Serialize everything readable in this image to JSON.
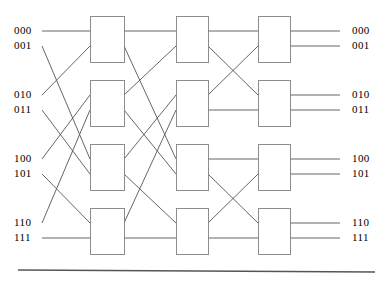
{
  "figure": {
    "width": 383,
    "height": 281,
    "background": "#ffffff",
    "line_color": "#555555",
    "box_fill": "#ffffff",
    "box_stroke": "#808080",
    "text_color": "#000000",
    "rule_color": "#555555"
  },
  "inputs": [
    {
      "label": "000",
      "x": 14,
      "y": 31,
      "port_y": 31
    },
    {
      "label": "001",
      "x": 14,
      "y": 46,
      "port_y": 46
    },
    {
      "label": "010",
      "x": 14,
      "y": 95,
      "port_y": 95
    },
    {
      "label": "011",
      "x": 14,
      "y": 110,
      "port_y": 110
    },
    {
      "label": "100",
      "x": 14,
      "y": 159,
      "port_y": 159
    },
    {
      "label": "101",
      "x": 14,
      "y": 174,
      "port_y": 174
    },
    {
      "label": "110",
      "x": 14,
      "y": 223,
      "port_y": 223
    },
    {
      "label": "111",
      "x": 14,
      "y": 238,
      "port_y": 238
    }
  ],
  "outputs": [
    {
      "label": "000",
      "x": 352,
      "y": 31,
      "port_y": 31
    },
    {
      "label": "001",
      "x": 352,
      "y": 46,
      "port_y": 46
    },
    {
      "label": "010",
      "x": 352,
      "y": 95,
      "port_y": 95
    },
    {
      "label": "011",
      "x": 352,
      "y": 110,
      "port_y": 110
    },
    {
      "label": "100",
      "x": 352,
      "y": 159,
      "port_y": 159
    },
    {
      "label": "101",
      "x": 352,
      "y": 174,
      "port_y": 174
    },
    {
      "label": "110",
      "x": 352,
      "y": 223,
      "port_y": 223
    },
    {
      "label": "111",
      "x": 352,
      "y": 238,
      "port_y": 238
    }
  ],
  "stages": [
    {
      "name": "stage-1",
      "x_left": 90,
      "x_right": 124,
      "switches": [
        {
          "name": "switch-1-1",
          "y_top": 16,
          "y_bottom": 62
        },
        {
          "name": "switch-1-2",
          "y_top": 80,
          "y_bottom": 126
        },
        {
          "name": "switch-1-3",
          "y_top": 144,
          "y_bottom": 190
        },
        {
          "name": "switch-1-4",
          "y_top": 208,
          "y_bottom": 254
        }
      ]
    },
    {
      "name": "stage-2",
      "x_left": 176,
      "x_right": 208,
      "switches": [
        {
          "name": "switch-2-1",
          "y_top": 16,
          "y_bottom": 62
        },
        {
          "name": "switch-2-2",
          "y_top": 80,
          "y_bottom": 126
        },
        {
          "name": "switch-2-3",
          "y_top": 144,
          "y_bottom": 190
        },
        {
          "name": "switch-2-4",
          "y_top": 208,
          "y_bottom": 254
        }
      ]
    },
    {
      "name": "stage-3",
      "x_left": 258,
      "x_right": 290,
      "switches": [
        {
          "name": "switch-3-1",
          "y_top": 16,
          "y_bottom": 62
        },
        {
          "name": "switch-3-2",
          "y_top": 80,
          "y_bottom": 126
        },
        {
          "name": "switch-3-3",
          "y_top": 144,
          "y_bottom": 190
        },
        {
          "name": "switch-3-4",
          "y_top": 208,
          "y_bottom": 254
        }
      ]
    }
  ],
  "rule": {
    "x1": 18,
    "y1": 270,
    "x2": 375,
    "y2": 272
  },
  "geometry": {
    "input_x_start": 42,
    "output_x_end": 340,
    "port_offsets": [
      15,
      30
    ],
    "stage_port_top": 16,
    "row_tops": [
      16,
      80,
      144,
      208
    ]
  },
  "wiring": {
    "input_to_stage1": [
      {
        "from_row": 0,
        "from_port": 0,
        "to_row": 0,
        "to_port": 0
      },
      {
        "from_row": 0,
        "from_port": 1,
        "to_row": 2,
        "to_port": 0
      },
      {
        "from_row": 1,
        "from_port": 0,
        "to_row": 0,
        "to_port": 1
      },
      {
        "from_row": 1,
        "from_port": 1,
        "to_row": 2,
        "to_port": 1
      },
      {
        "from_row": 2,
        "from_port": 0,
        "to_row": 1,
        "to_port": 0
      },
      {
        "from_row": 2,
        "from_port": 1,
        "to_row": 3,
        "to_port": 0
      },
      {
        "from_row": 3,
        "from_port": 0,
        "to_row": 1,
        "to_port": 1
      },
      {
        "from_row": 3,
        "from_port": 1,
        "to_row": 3,
        "to_port": 1
      }
    ],
    "stage1_to_stage2": [
      {
        "from_row": 0,
        "from_port": 0,
        "to_row": 0,
        "to_port": 0
      },
      {
        "from_row": 0,
        "from_port": 1,
        "to_row": 2,
        "to_port": 0
      },
      {
        "from_row": 1,
        "from_port": 0,
        "to_row": 0,
        "to_port": 1
      },
      {
        "from_row": 1,
        "from_port": 1,
        "to_row": 2,
        "to_port": 1
      },
      {
        "from_row": 2,
        "from_port": 0,
        "to_row": 1,
        "to_port": 0
      },
      {
        "from_row": 2,
        "from_port": 1,
        "to_row": 3,
        "to_port": 0
      },
      {
        "from_row": 3,
        "from_port": 0,
        "to_row": 1,
        "to_port": 1
      },
      {
        "from_row": 3,
        "from_port": 1,
        "to_row": 3,
        "to_port": 1
      }
    ],
    "stage2_to_stage3": [
      {
        "from_row": 0,
        "from_port": 0,
        "to_row": 0,
        "to_port": 0
      },
      {
        "from_row": 0,
        "from_port": 1,
        "to_row": 1,
        "to_port": 0
      },
      {
        "from_row": 1,
        "from_port": 0,
        "to_row": 0,
        "to_port": 1
      },
      {
        "from_row": 1,
        "from_port": 1,
        "to_row": 1,
        "to_port": 1
      },
      {
        "from_row": 2,
        "from_port": 0,
        "to_row": 2,
        "to_port": 0
      },
      {
        "from_row": 2,
        "from_port": 1,
        "to_row": 3,
        "to_port": 0
      },
      {
        "from_row": 3,
        "from_port": 0,
        "to_row": 2,
        "to_port": 1
      },
      {
        "from_row": 3,
        "from_port": 1,
        "to_row": 3,
        "to_port": 1
      }
    ],
    "stage3_to_output": [
      {
        "from_row": 0,
        "from_port": 0,
        "to_index": 0
      },
      {
        "from_row": 0,
        "from_port": 1,
        "to_index": 1
      },
      {
        "from_row": 1,
        "from_port": 0,
        "to_index": 2
      },
      {
        "from_row": 1,
        "from_port": 1,
        "to_index": 3
      },
      {
        "from_row": 2,
        "from_port": 0,
        "to_index": 4
      },
      {
        "from_row": 2,
        "from_port": 1,
        "to_index": 5
      },
      {
        "from_row": 3,
        "from_port": 0,
        "to_index": 6
      },
      {
        "from_row": 3,
        "from_port": 1,
        "to_index": 7
      }
    ]
  }
}
